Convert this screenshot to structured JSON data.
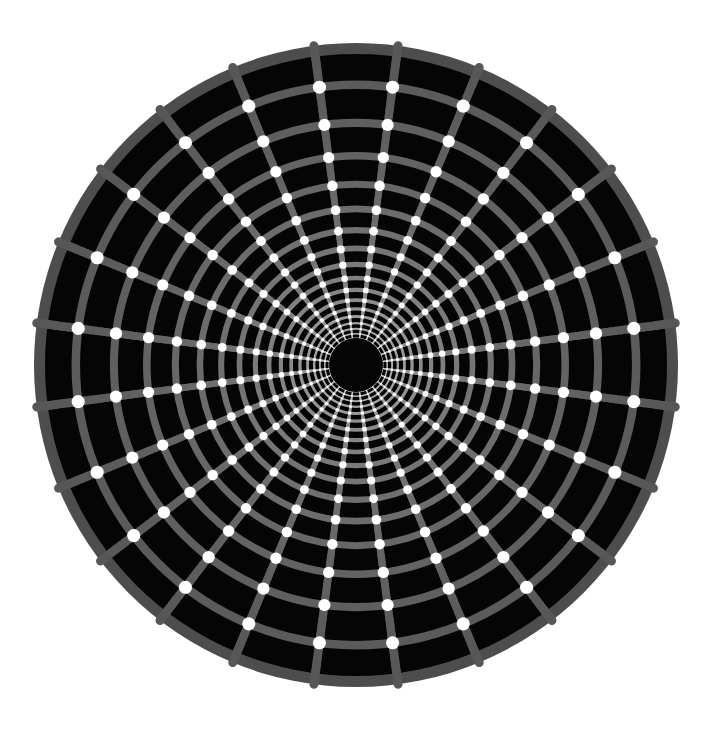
{
  "figure": {
    "title": "Concentric Polar Grid Optical Illusion",
    "type": "optical-illusion-disk"
  },
  "canvas": {
    "width": 713,
    "height": 739,
    "background_color": "#ffffff"
  },
  "disk": {
    "center_x": 356,
    "center_y": 365,
    "outer_radius": 322,
    "core_radius": 27,
    "fill_color": "#050505",
    "rim_color": "#4d4d4d",
    "rim_width": 11
  },
  "grid": {
    "spoke_count": 24,
    "spoke_angle_step_deg": 15,
    "spoke_angle_offset_deg": 7.5,
    "ring_count": 18,
    "ring_growth_ratio": 1.1575,
    "line_color": "#575757",
    "line_color_inner": "#cfcfcf",
    "line_width_outer": 9,
    "line_width_inner": 1.1
  },
  "dots": {
    "color": "#ffffff",
    "radius_outer": 7.0,
    "radius_inner": 0.8,
    "placement": "every ring-spoke intersection",
    "total_count": 432
  },
  "chart_data": {
    "type": "scatter",
    "title": "Concentric Polar Grid Optical Illusion",
    "subtitle": "",
    "xlabel": "",
    "ylabel": "",
    "grid": true,
    "legend_position": "none",
    "coordinate_system": "polar",
    "center": [
      356,
      365
    ],
    "xlim": [
      0,
      713
    ],
    "ylim": [
      0,
      739
    ],
    "angles_deg": [
      7.5,
      22.5,
      37.5,
      52.5,
      67.5,
      82.5,
      97.5,
      112.5,
      127.5,
      142.5,
      157.5,
      172.5,
      187.5,
      202.5,
      217.5,
      232.5,
      247.5,
      262.5,
      277.5,
      292.5,
      307.5,
      322.5,
      337.5,
      352.5
    ],
    "ring_radii": [
      27.0,
      31.3,
      36.2,
      41.9,
      48.5,
      56.1,
      64.9,
      75.2,
      87.0,
      100.7,
      116.6,
      134.9,
      156.1,
      180.7,
      209.2,
      242.1,
      280.2,
      322.0
    ],
    "annotations": []
  }
}
